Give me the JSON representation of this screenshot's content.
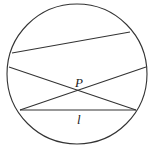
{
  "diagram": {
    "type": "geometry",
    "circle": {
      "cx": 77,
      "cy": 74,
      "r": 70,
      "stroke": "#333333"
    },
    "chords": [
      {
        "id": "top",
        "x1": 12,
        "y1": 53,
        "x2": 130,
        "y2": 32
      },
      {
        "id": "cross-down",
        "x1": 9,
        "y1": 67,
        "x2": 136,
        "y2": 110
      },
      {
        "id": "cross-up",
        "x1": 20,
        "y1": 110,
        "x2": 146,
        "y2": 67
      },
      {
        "id": "l",
        "x1": 20,
        "y1": 110,
        "x2": 136,
        "y2": 110
      }
    ],
    "labels": {
      "point_p": "P",
      "line_l": "l"
    }
  }
}
